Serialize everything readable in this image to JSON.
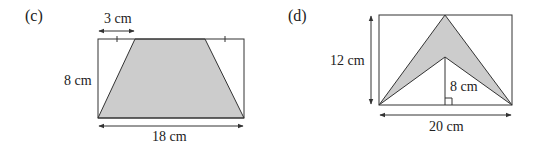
{
  "figures": [
    {
      "id": "c",
      "part_label": "(c)",
      "shape": "trapezium inside rectangle",
      "labels": {
        "top_offset": "3 cm",
        "height": "8 cm",
        "base": "18 cm"
      },
      "shading": "#cccccc"
    },
    {
      "id": "d",
      "part_label": "(d)",
      "shape": "arrowhead (chevron) inside rectangle",
      "labels": {
        "height": "12 cm",
        "inner_height": "8 cm",
        "base": "20 cm"
      },
      "shading": "#cccccc"
    }
  ],
  "colors": {
    "stroke": "#333333",
    "fill": "#cccccc",
    "background": "#ffffff"
  }
}
